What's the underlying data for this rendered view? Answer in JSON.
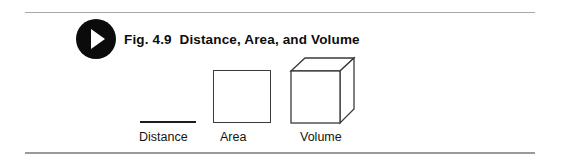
{
  "figure": {
    "badge_icon": "play-triangle-icon",
    "caption": "Fig. 4.9  Distance, Area, and Volume",
    "caption_number": "Fig. 4.9",
    "caption_title": "Distance, Area, and Volume"
  },
  "diagram": {
    "type": "geometric-dimension-illustration",
    "items": [
      {
        "label": "Distance",
        "shape": "line-segment",
        "dimension": "1D",
        "shape_icon": "line-segment-icon"
      },
      {
        "label": "Area",
        "shape": "square",
        "dimension": "2D",
        "shape_icon": "square-icon"
      },
      {
        "label": "Volume",
        "shape": "cube",
        "dimension": "3D",
        "shape_icon": "cube-icon"
      }
    ]
  },
  "colors": {
    "ink": "#0d0d0d",
    "badge_fill": "#0b0b0b",
    "badge_glyph": "#ffffff",
    "stroke": "#3a3a3a",
    "rule_top": "#a8a8a8",
    "rule_bottom": "#9a9a9a",
    "background": "#ffffff"
  }
}
